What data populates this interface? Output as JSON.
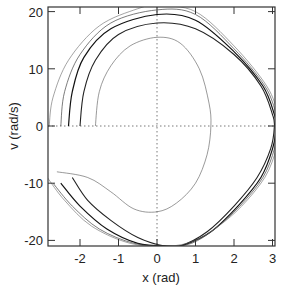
{
  "chart_data": {
    "type": "line",
    "title": "",
    "xlabel": "x (rad)",
    "ylabel": "v (rad/s)",
    "xlim": [
      -2.85,
      3.05
    ],
    "ylim": [
      -21,
      20.6
    ],
    "xticks": [
      -2,
      -1,
      0,
      1,
      2,
      3
    ],
    "yticks": [
      -20,
      -10,
      0,
      10,
      20
    ],
    "xtick_labels": [
      "-2",
      "-1",
      "0",
      "1",
      "2",
      "3"
    ],
    "ytick_labels": [
      "-20",
      "-10",
      "0",
      "10",
      "20"
    ],
    "grid": "dotted zero lines at x=0 and v=0",
    "legend": null,
    "series": [
      {
        "name": "orbit-1",
        "width": 0.6,
        "color": "#555555",
        "points": [
          [
            -1.6,
            0
          ],
          [
            -1.5,
            6
          ],
          [
            -1.2,
            10.5
          ],
          [
            -0.7,
            14
          ],
          [
            0,
            15.5
          ],
          [
            0.6,
            14.5
          ],
          [
            1.1,
            10
          ],
          [
            1.35,
            4
          ],
          [
            1.4,
            0
          ],
          [
            1.3,
            -5
          ],
          [
            1.0,
            -10
          ],
          [
            0.5,
            -13.5
          ],
          [
            0,
            -15
          ],
          [
            -0.6,
            -14.5
          ],
          [
            -1.2,
            -11.5
          ],
          [
            -1.8,
            -9
          ],
          [
            -2.6,
            -8
          ]
        ]
      },
      {
        "name": "orbit-2",
        "width": 1.1,
        "color": "#222222",
        "points": [
          [
            -2.0,
            0
          ],
          [
            -1.9,
            6
          ],
          [
            -1.6,
            11.5
          ],
          [
            -1.0,
            16
          ],
          [
            0,
            18
          ],
          [
            1.0,
            17
          ],
          [
            2.0,
            12.5
          ],
          [
            2.7,
            7
          ],
          [
            3.0,
            2
          ],
          [
            3.05,
            0
          ],
          [
            2.95,
            -4
          ],
          [
            2.6,
            -9
          ],
          [
            2.0,
            -14
          ],
          [
            1.3,
            -18.5
          ],
          [
            0.6,
            -21
          ],
          [
            0.2,
            -21
          ],
          [
            -0.5,
            -19.5
          ],
          [
            -1.2,
            -16.5
          ],
          [
            -1.8,
            -13
          ],
          [
            -2.2,
            -9
          ]
        ]
      },
      {
        "name": "orbit-3",
        "width": 1.2,
        "color": "#111111",
        "points": [
          [
            -2.3,
            0
          ],
          [
            -2.2,
            6
          ],
          [
            -1.9,
            12
          ],
          [
            -1.2,
            17
          ],
          [
            0,
            19.5
          ],
          [
            1.0,
            18.5
          ],
          [
            2.0,
            13
          ],
          [
            2.75,
            7
          ],
          [
            3.05,
            2
          ],
          [
            3.1,
            0
          ],
          [
            3.0,
            -4
          ],
          [
            2.7,
            -9
          ],
          [
            2.1,
            -14
          ],
          [
            1.4,
            -18.5
          ],
          [
            0.7,
            -20.8
          ],
          [
            0.3,
            -21
          ],
          [
            -0.5,
            -20.5
          ],
          [
            -1.3,
            -18
          ],
          [
            -2.0,
            -14
          ],
          [
            -2.5,
            -10
          ]
        ]
      },
      {
        "name": "orbit-4",
        "width": 0.7,
        "color": "#444444",
        "points": [
          [
            -2.5,
            0
          ],
          [
            -2.4,
            6
          ],
          [
            -2.0,
            12.5
          ],
          [
            -1.2,
            18
          ],
          [
            0,
            20.3
          ],
          [
            1.0,
            19.5
          ],
          [
            2.0,
            13.5
          ],
          [
            2.8,
            7
          ],
          [
            3.1,
            2
          ],
          [
            3.15,
            0
          ],
          [
            3.05,
            -4
          ],
          [
            2.75,
            -9
          ],
          [
            2.15,
            -14
          ],
          [
            1.5,
            -18
          ],
          [
            0.9,
            -20.5
          ],
          [
            0.3,
            -21
          ],
          [
            -0.6,
            -20.5
          ],
          [
            -1.5,
            -18
          ],
          [
            -2.2,
            -14
          ],
          [
            -2.7,
            -10
          ]
        ]
      },
      {
        "name": "orbit-5",
        "width": 0.6,
        "color": "#666666",
        "points": [
          [
            -2.8,
            0
          ],
          [
            -2.7,
            5
          ],
          [
            -2.3,
            11.5
          ],
          [
            -1.5,
            17.5
          ],
          [
            -0.5,
            20.5
          ],
          [
            0,
            21
          ],
          [
            1.0,
            20
          ],
          [
            2.0,
            14
          ],
          [
            2.85,
            7
          ],
          [
            3.15,
            2
          ],
          [
            3.2,
            0
          ],
          [
            3.1,
            -4
          ],
          [
            2.8,
            -9
          ],
          [
            2.2,
            -14
          ],
          [
            1.6,
            -17.5
          ],
          [
            1.0,
            -20
          ],
          [
            0.3,
            -21
          ],
          [
            -0.7,
            -20.5
          ],
          [
            -1.7,
            -17.5
          ],
          [
            -2.4,
            -13
          ],
          [
            -2.85,
            -9
          ]
        ]
      }
    ]
  }
}
